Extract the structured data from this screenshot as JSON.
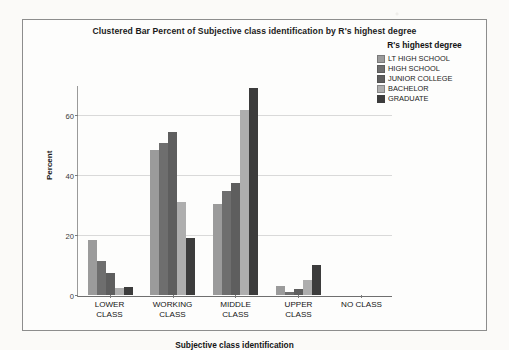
{
  "chart_data": {
    "type": "bar",
    "title": "Clustered Bar Percent of Subjective class identification by R's highest degree",
    "xlabel": "Subjective class identification",
    "ylabel": "Percent",
    "ylim": [
      0,
      70
    ],
    "yticks": [
      0,
      20,
      40,
      60
    ],
    "ytick_labels": [
      "0",
      "20",
      "40",
      "60"
    ],
    "grid": true,
    "legend_position": "top-right",
    "legend_title": "R's highest degree",
    "categories": [
      "LOWER\nCLASS",
      "WORKING\nCLASS",
      "MIDDLE\nCLASS",
      "UPPER\nCLASS",
      "NO CLASS"
    ],
    "category_labels": [
      "LOWER CLASS",
      "WORKING CLASS",
      "MIDDLE CLASS",
      "UPPER CLASS",
      "NO CLASS"
    ],
    "series": [
      {
        "name": "LT HIGH SCHOOL",
        "color": "#9b9b9b",
        "values": [
          18.5,
          48.5,
          30.5,
          3.0,
          0
        ]
      },
      {
        "name": "HIGH SCHOOL",
        "color": "#6e6e6e",
        "values": [
          11.5,
          51.0,
          35.0,
          1.0,
          0
        ]
      },
      {
        "name": "JUNIOR COLLEGE",
        "color": "#5e5e5e",
        "values": [
          7.5,
          54.5,
          37.5,
          2.0,
          0
        ]
      },
      {
        "name": "BACHELOR",
        "color": "#aeaeae",
        "values": [
          2.2,
          31.0,
          62.0,
          5.0,
          0
        ]
      },
      {
        "name": "GRADUATE",
        "color": "#3c3c3c",
        "values": [
          2.6,
          19.0,
          69.5,
          10.0,
          0
        ]
      }
    ]
  }
}
